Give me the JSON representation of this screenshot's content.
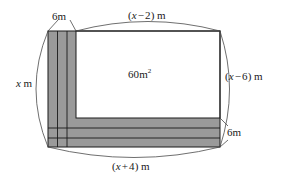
{
  "figure": {
    "name": "rectangular-garden-with-l-shaped-path",
    "type": "geometry-diagram",
    "canvas": {
      "width": 287,
      "height": 188
    },
    "colors": {
      "shading": "#9a9a9a",
      "stroke": "#1a1a1a",
      "brace": "#4a4a4a",
      "interior": "#ffffff",
      "background": "#ffffff"
    },
    "labels": {
      "top": {
        "open": "(",
        "variable": "x",
        "operator": "−",
        "number": "2",
        "close": ")",
        "unit": "m",
        "text": "(x − 2) m"
      },
      "right": {
        "open": "(",
        "variable": "x",
        "operator": "−",
        "number": "6",
        "close": ")",
        "unit": "m",
        "text": "(x − 6) m"
      },
      "bottom": {
        "open": "(",
        "variable": "x",
        "operator": "+",
        "number": "4",
        "close": ")",
        "unit": "m",
        "text": "(x + 4) m"
      },
      "left": {
        "variable": "x",
        "unit": "m",
        "text": "x m"
      },
      "area": {
        "value": "60",
        "unit": "m",
        "exponent": "2",
        "text": "60m²"
      },
      "vertical_band": {
        "text": "6m"
      },
      "horizontal_band": {
        "text": "6m"
      }
    },
    "geometry": {
      "outer": {
        "x": 48,
        "y": 31,
        "width": 172,
        "height": 116
      },
      "interior": {
        "x": 76,
        "y": 31,
        "width": 144,
        "height": 87
      },
      "vertical_band": {
        "x": 48,
        "y": 31,
        "width": 28,
        "height": 116,
        "dividers": [
          57,
          67
        ]
      },
      "horizontal_band": {
        "x": 48,
        "y": 118,
        "width": 172,
        "height": 29,
        "dividers": [
          128,
          138
        ]
      }
    },
    "braces": {
      "top": {
        "from_x": 76,
        "to_x": 220,
        "y": 31,
        "bulge": 14
      },
      "right": {
        "x": 220,
        "from_y": 31,
        "to_y": 147,
        "bulge": 16
      },
      "bottom": {
        "from_x": 48,
        "to_x": 220,
        "y": 147,
        "bulge": 15
      },
      "left": {
        "x": 48,
        "from_y": 31,
        "to_y": 147,
        "bulge": 21
      }
    }
  }
}
